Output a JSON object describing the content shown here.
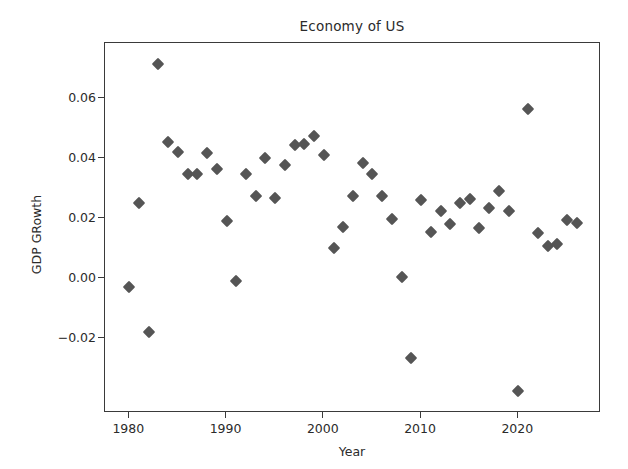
{
  "chart_data": {
    "type": "scatter",
    "title": "Economy of US",
    "xlabel": "Year",
    "ylabel": "GDP GRowth",
    "xlim": [
      1977.5,
      2028.5
    ],
    "ylim": [
      -0.045,
      0.0785
    ],
    "xticks": [
      1980,
      1990,
      2000,
      2010,
      2020
    ],
    "xticklabels": [
      "1980",
      "1990",
      "2000",
      "2010",
      "2020"
    ],
    "yticks": [
      -0.02,
      0.0,
      0.02,
      0.04,
      0.06
    ],
    "yticklabels": [
      "−0.02",
      "0.00",
      "0.02",
      "0.04",
      "0.06"
    ],
    "grid": false,
    "legend": null,
    "marker": "diamond",
    "marker_color": "#555555",
    "series_name": "GDP Growth",
    "x": [
      1980,
      1981,
      1982,
      1983,
      1984,
      1985,
      1986,
      1987,
      1988,
      1989,
      1990,
      1991,
      1992,
      1993,
      1994,
      1995,
      1996,
      1997,
      1998,
      1999,
      2000,
      2001,
      2002,
      2003,
      2004,
      2005,
      2006,
      2007,
      2008,
      2009,
      2010,
      2011,
      2012,
      2013,
      2014,
      2015,
      2016,
      2017,
      2018,
      2019,
      2020,
      2021,
      2022,
      2023,
      2024,
      2025,
      2026
    ],
    "y": [
      -0.003,
      0.025,
      -0.018,
      0.0715,
      0.0455,
      0.042,
      0.0348,
      0.0347,
      0.0418,
      0.0365,
      0.019,
      -0.001,
      0.0348,
      0.0275,
      0.04,
      0.0268,
      0.0377,
      0.0445,
      0.0448,
      0.0475,
      0.041,
      0.01,
      0.017,
      0.0275,
      0.0385,
      0.0347,
      0.0275,
      0.0196,
      0.0005,
      -0.0265,
      0.026,
      0.0155,
      0.0225,
      0.018,
      0.025,
      0.0265,
      0.0168,
      0.0235,
      0.029,
      0.0225,
      -0.0375,
      0.0565,
      0.015,
      0.0108,
      0.0113,
      0.0195,
      0.0183
    ]
  },
  "figure": {
    "background": "#ffffff",
    "axes_edge_color": "#3a3a3a",
    "text_color": "#2b2b2b"
  }
}
